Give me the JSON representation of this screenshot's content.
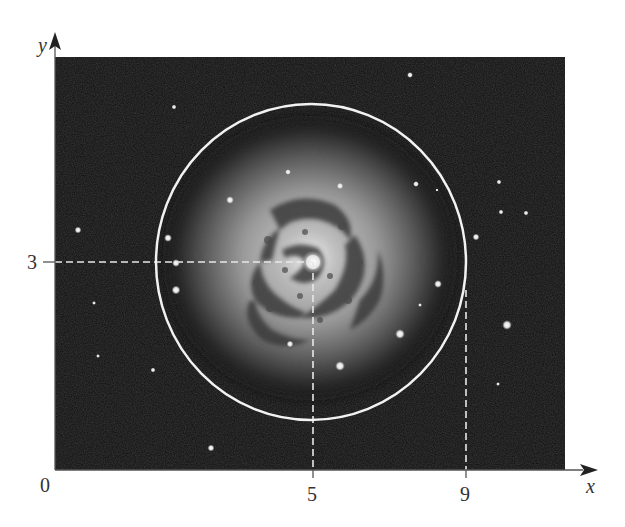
{
  "figure": {
    "colors": {
      "background": "#ffffff",
      "photo_background": "#0e0e0e",
      "circle_stroke": "#f2f2f2",
      "dash_stroke": "#e8e8e8",
      "axis_stroke": "#444444",
      "label_color": "#333333"
    },
    "axes": {
      "x_label": "x",
      "y_label": "y",
      "origin_label": "0"
    },
    "ticks": {
      "x": [
        {
          "label": "5",
          "value": 5
        },
        {
          "label": "9",
          "value": 9
        }
      ],
      "y": [
        {
          "label": "3",
          "value": 3
        }
      ]
    },
    "circle": {
      "center": {
        "x": 5,
        "y": 3
      },
      "radius": 4,
      "equation_hint": "(x-5)^2 + (y-3)^2 = 16"
    },
    "guides": [
      {
        "type": "horizontal-dashed",
        "from_x": 0,
        "to_x": 5,
        "at_y": 3
      },
      {
        "type": "vertical-dashed",
        "at_x": 5,
        "from_y": 0,
        "to_y": 3
      },
      {
        "type": "vertical-dashed",
        "at_x": 9,
        "from_y": 0,
        "to_y": 2.4
      }
    ]
  }
}
